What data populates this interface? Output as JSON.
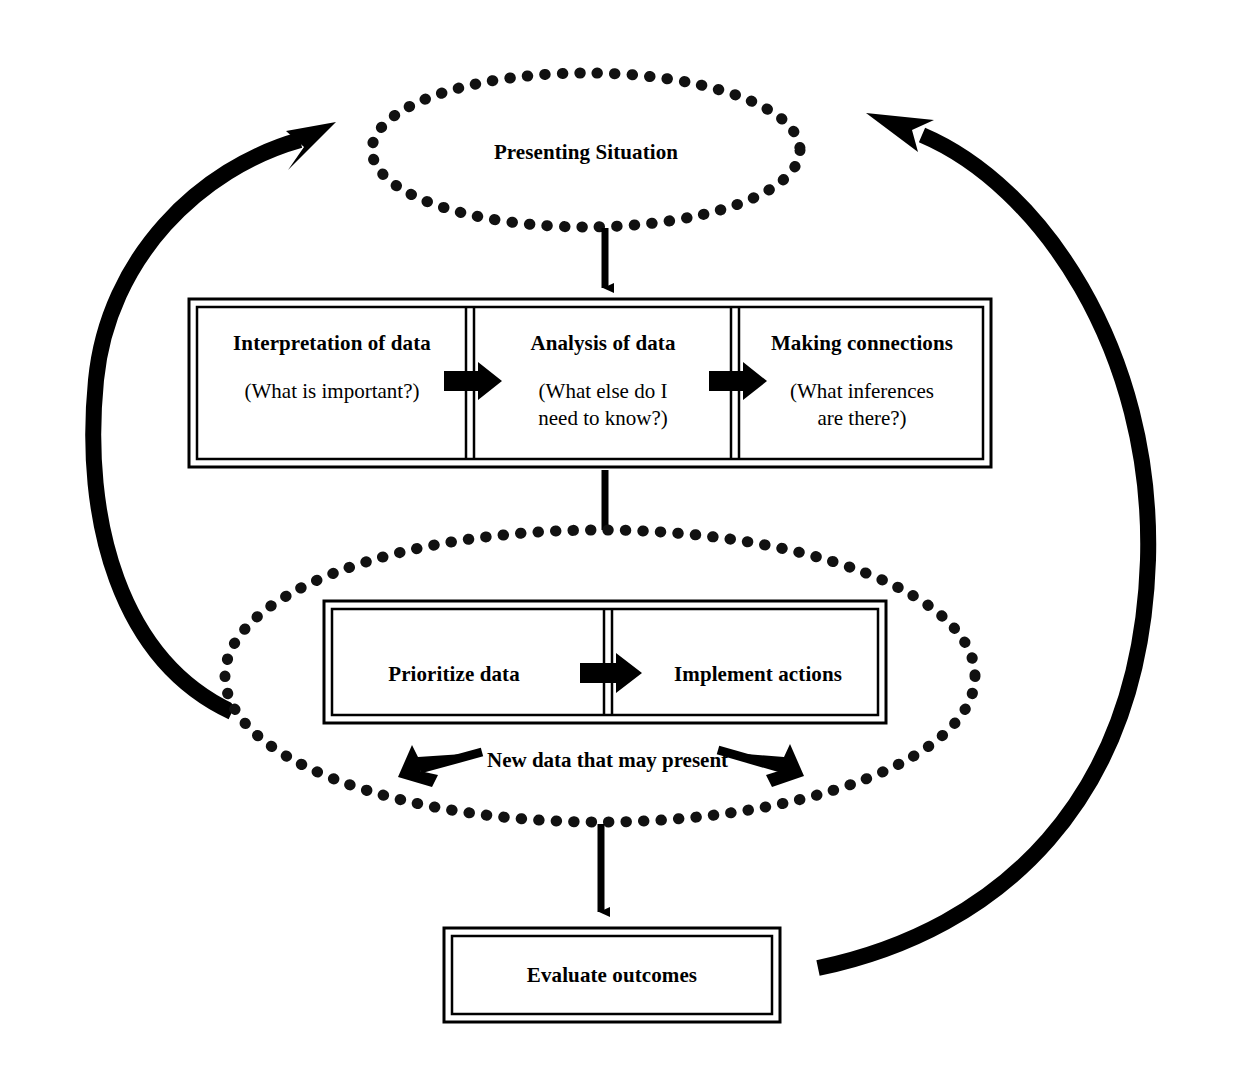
{
  "diagram": {
    "colors": {
      "ink": "#111111",
      "background": "#ffffff",
      "line": "#000000"
    },
    "nodes": {
      "presenting_situation": {
        "label": "Presenting Situation",
        "shape": "dotted-ellipse"
      },
      "interpretation": {
        "heading": "Interpretation of data",
        "question": "(What is important?)"
      },
      "analysis": {
        "heading": "Analysis of data",
        "question_line1": "(What else do I",
        "question_line2": "need to know?)"
      },
      "connections": {
        "heading": "Making connections",
        "question_line1": "(What inferences",
        "question_line2": "are there?)"
      },
      "prioritize": {
        "label": "Prioritize data"
      },
      "implement": {
        "label": "Implement actions"
      },
      "new_data": {
        "label": "New data that may present"
      },
      "evaluate": {
        "label": "Evaluate outcomes"
      }
    },
    "connectors": {
      "situation_to_process": "down-arrow",
      "process_to_action": "down-arrow",
      "action_to_evaluate": "down-arrow",
      "interpretation_to_analysis": "right-arrow",
      "analysis_to_connections": "right-arrow",
      "prioritize_to_implement": "right-arrow",
      "new_data_left": "left-arrow",
      "new_data_right": "right-arrow",
      "feedback_left": "curved-arrow-up",
      "feedback_right": "curved-arrow-up"
    }
  }
}
